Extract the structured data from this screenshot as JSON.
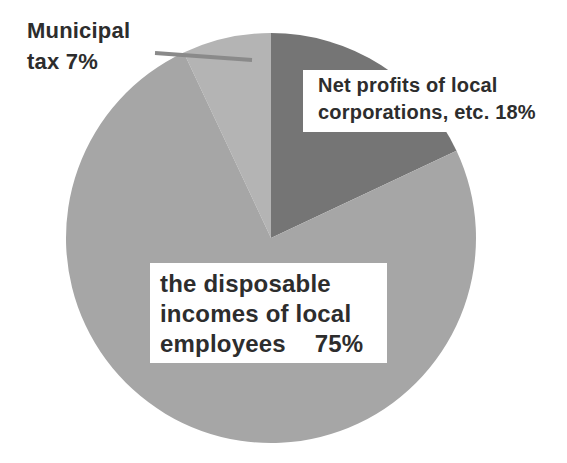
{
  "chart_data": {
    "type": "pie",
    "title": "",
    "unit": "%",
    "legend_position": "none",
    "start_angle_deg_clockwise_from_12": -25.2,
    "slices": [
      {
        "id": "municipal-tax",
        "label": "Municipal tax",
        "value": 7,
        "color": "#b4b4b4"
      },
      {
        "id": "net-profits",
        "label": "Net profits of local corporations, etc.",
        "value": 18,
        "color": "#757575"
      },
      {
        "id": "disposable-incomes",
        "label": "the disposable incomes of local employees",
        "value": 75,
        "color": "#a6a6a6"
      }
    ]
  },
  "labels": {
    "municipal": {
      "line1": "Municipal",
      "line2": "tax 7%"
    },
    "net_profits": {
      "line1": "Net profits of local",
      "line2": "corporations, etc. 18%"
    },
    "employees": {
      "line1": "the disposable",
      "line2": "incomes of local",
      "line3_label": "employees",
      "line3_value": "75%"
    }
  },
  "colors": {
    "background": "#ffffff",
    "text": "#2d2d2d",
    "label_box_background": "#ffffff",
    "leader_line": "#8a8a8a"
  }
}
